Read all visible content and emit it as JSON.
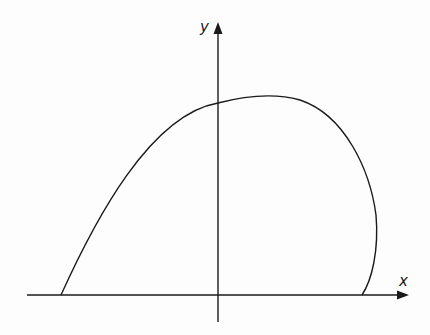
{
  "diagram": {
    "x_axis_label": "x",
    "y_axis_label": "y",
    "stroke_color": "#1a1a1a",
    "curve_path": "M61,295 C95,220 150,115 218,103 C245,96 275,93 300,100 C345,115 370,170 376,215 C379,250 372,280 362,295"
  }
}
